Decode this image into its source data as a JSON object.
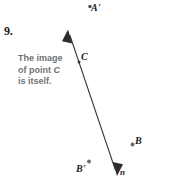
{
  "figure": {
    "exercise_number": "9.",
    "background_color": "#ffffff",
    "ink_color": "#3a3a3a",
    "callout_color": "#6f7275",
    "callout": {
      "line1": "The image",
      "line2_prefix": "of point ",
      "line2_var": "C",
      "line3": "is itself."
    },
    "line_label": "n",
    "points": [
      {
        "id": "a-prime",
        "label": "A'",
        "dot_x": 90,
        "dot_y": 6.5
      },
      {
        "id": "c",
        "label": "C",
        "dot_x": 79,
        "dot_y": 62
      },
      {
        "id": "b",
        "label": "B",
        "dot_x": 132.5,
        "dot_y": 144.5
      },
      {
        "id": "b-prime",
        "label": "B'",
        "dot_x": 89,
        "dot_y": 161.5
      }
    ],
    "line_n": {
      "x1": 68,
      "y1": 30,
      "x2": 117,
      "y2": 175,
      "double_headed": true
    }
  }
}
